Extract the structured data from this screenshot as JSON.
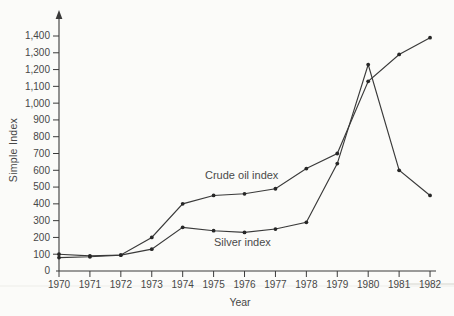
{
  "figure": {
    "background": "#fbfbf9",
    "ink_color": "#3a3a3a",
    "text_color": "#474747",
    "marker_color": "#272727",
    "page_rule_color": "#d4d4cd"
  },
  "chart_data": {
    "type": "line",
    "title": "",
    "xlabel": "Year",
    "ylabel": "Simple Index",
    "x_tick_labels": [
      "1970",
      "1971",
      "1972",
      "1973",
      "1974",
      "1975",
      "1976",
      "1977",
      "1978",
      "1979",
      "1980",
      "1981",
      "1982"
    ],
    "ylim": [
      0,
      1400
    ],
    "ytick_interval": 100,
    "ytick_labels": [
      "100",
      "200",
      "300",
      "400",
      "500",
      "600",
      "700",
      "800",
      "900",
      "1,000",
      "1,100",
      "1,200",
      "1,300",
      "1,400"
    ],
    "origin_label": "0",
    "grid": false,
    "legend_position": "inline-annotations",
    "series": [
      {
        "name": "Crude oil index",
        "marker": "dot",
        "values": [
          100,
          90,
          95,
          200,
          400,
          450,
          460,
          490,
          610,
          700,
          1130,
          1290,
          1390
        ]
      },
      {
        "name": "Silver index",
        "marker": "dot",
        "values": [
          80,
          85,
          95,
          130,
          260,
          240,
          230,
          250,
          290,
          640,
          1230,
          600,
          450
        ]
      }
    ]
  }
}
